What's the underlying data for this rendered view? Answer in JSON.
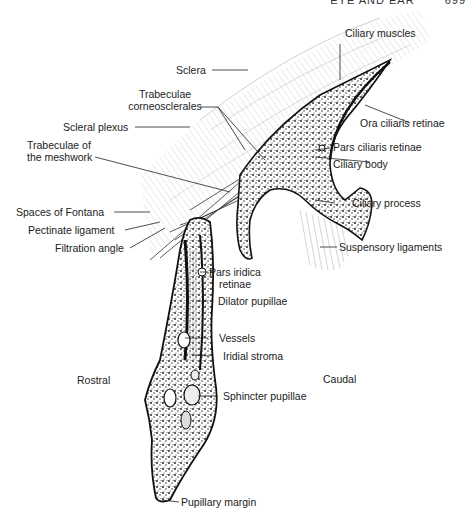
{
  "header": {
    "running_title": "EYE AND EAR",
    "page_number": "699"
  },
  "figure": {
    "orientation": {
      "left": "Rostral",
      "right": "Caudal"
    },
    "labels": {
      "ciliary_muscles": "Ciliary muscles",
      "sclera": "Sclera",
      "trabeculae_corneosclerales_1": "Trabeculae",
      "trabeculae_corneosclerales_2": "corneosclerales",
      "scleral_plexus": "Scleral plexus",
      "ora_ciliaris_retinae": "Ora ciliaris retinae",
      "trabeculae_meshwork_1": "Trabeculae of",
      "trabeculae_meshwork_2": "the meshwork",
      "pars_ciliaris_retinae": "Pars ciliaris retinae",
      "ciliary_body": "Ciliary body",
      "ciliary_process": "Ciliary process",
      "spaces_of_fontana": "Spaces of Fontana",
      "pectinate_ligament": "Pectinate ligament",
      "filtration_angle": "Filtration angle",
      "suspensory_ligaments": "Suspensory ligaments",
      "pars_iridica_retinae_1": "Pars iridica",
      "pars_iridica_retinae_2": "retinae",
      "dilator_pupillae": "Dilator pupillae",
      "vessels": "Vessels",
      "iridial_stroma": "Iridial stroma",
      "sphincter_pupillae": "Sphincter pupillae",
      "pupillary_margin": "Pupillary margin"
    },
    "colors": {
      "ink": "#111111",
      "hatch": "#9a9a9a",
      "label": "#222222"
    }
  }
}
